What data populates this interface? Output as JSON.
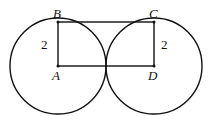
{
  "diagram": {
    "points": [
      {
        "label": "A",
        "x": 58,
        "y": 66
      },
      {
        "label": "B",
        "x": 58,
        "y": 22
      },
      {
        "label": "C",
        "x": 154,
        "y": 22
      },
      {
        "label": "D",
        "x": 154,
        "y": 66
      }
    ],
    "circles": [
      {
        "center": "A",
        "radius": 2
      },
      {
        "center": "D",
        "radius": 2
      }
    ],
    "segment_labels": [
      {
        "segment": "AB",
        "value": "2"
      },
      {
        "segment": "CD",
        "value": "2"
      }
    ],
    "shape": "rectangle ABCD"
  },
  "labels": {
    "A": "A",
    "B": "B",
    "C": "C",
    "D": "D",
    "ab_len": "2",
    "cd_len": "2"
  }
}
